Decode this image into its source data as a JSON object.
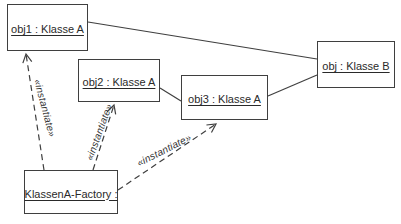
{
  "diagram": {
    "type": "uml-object-diagram",
    "boxes": {
      "obj1": {
        "label": "obj1 : Klasse A"
      },
      "obj2": {
        "label": "obj2 : Klasse A"
      },
      "obj3": {
        "label": "obj3 : Klasse A"
      },
      "objB": {
        "label": "obj : Klasse B"
      },
      "factory": {
        "label": "KlassenA-Factory :"
      }
    },
    "connector_labels": {
      "instantiate1": "«instantiate»",
      "instantiate2": "«instantiate»",
      "instantiate3": "«instantiate»"
    },
    "colors": {
      "background": "#ffffff",
      "box_fill": "#ffffff",
      "stroke": "#3f3f3f",
      "text": "#2a2a2a"
    }
  }
}
